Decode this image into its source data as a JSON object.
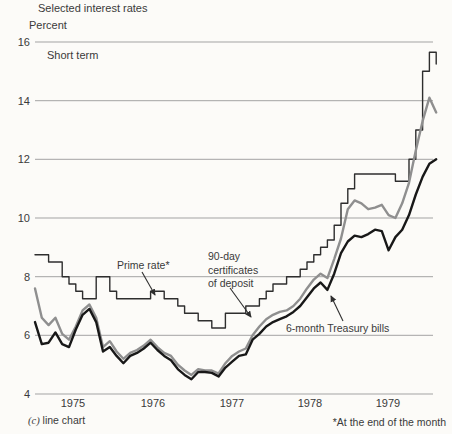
{
  "figure": {
    "title": "Selected interest rates",
    "y_axis_label": "Percent",
    "chart_label": "Short term",
    "caption_prefix": "(c)",
    "caption_text": "line chart",
    "footnote": "*At the end of the month"
  },
  "annotations": {
    "prime": "Prime rate*",
    "cd_line1": "90-day",
    "cd_line2": "certificates",
    "cd_line3": "of deposit",
    "tbill": "6-month Treasury bills"
  },
  "colors": {
    "grid": "#a3a3a3",
    "text": "#3a3a3a",
    "background": "#fcfbf8",
    "prime_line": "#2e2e2e",
    "cd_line": "#8f8f8f",
    "tbill_line": "#181818"
  },
  "chart_data": {
    "type": "line",
    "title": "Selected interest rates",
    "ylabel": "Percent",
    "ylim": [
      4,
      16
    ],
    "y_ticks": [
      "16",
      "14",
      "12",
      "10",
      "8",
      "6",
      "4"
    ],
    "y_tick_values": [
      16,
      14,
      12,
      10,
      8,
      6,
      4
    ],
    "grid": "horizontal",
    "x_unit": "monthly, end of month",
    "x_range": "Jan 1975 - Dec 1979",
    "year_labels": [
      "1975",
      "1976",
      "1977",
      "1978",
      "1979"
    ],
    "series": [
      {
        "name": "Prime rate",
        "style": "step",
        "color": "#2e2e2e",
        "width": 1.4,
        "values": [
          8.75,
          8.75,
          8.5,
          8.5,
          8.0,
          7.75,
          7.5,
          7.25,
          7.25,
          8.0,
          8.0,
          7.5,
          7.25,
          7.25,
          7.25,
          7.25,
          7.25,
          7.5,
          7.5,
          7.25,
          7.25,
          7.0,
          6.75,
          6.75,
          6.5,
          6.5,
          6.25,
          6.25,
          6.75,
          6.75,
          6.75,
          7.0,
          7.0,
          7.25,
          7.5,
          7.75,
          7.75,
          8.0,
          8.0,
          8.25,
          8.5,
          8.75,
          9.0,
          9.25,
          9.75,
          10.5,
          11.0,
          11.5,
          11.5,
          11.5,
          11.5,
          11.5,
          11.5,
          11.25,
          11.25,
          12.0,
          13.0,
          15.0,
          15.65,
          15.25
        ]
      },
      {
        "name": "90-day certificates of deposit",
        "style": "line",
        "color": "#8f8f8f",
        "width": 2.4,
        "values": [
          7.6,
          6.6,
          6.35,
          6.6,
          6.05,
          5.85,
          6.3,
          6.85,
          7.05,
          6.6,
          5.6,
          5.8,
          5.45,
          5.2,
          5.4,
          5.5,
          5.65,
          5.85,
          5.6,
          5.4,
          5.3,
          5.0,
          4.8,
          4.65,
          4.85,
          4.8,
          4.8,
          4.7,
          5.05,
          5.3,
          5.45,
          5.55,
          6.0,
          6.3,
          6.55,
          6.7,
          6.8,
          6.85,
          7.0,
          7.25,
          7.6,
          7.9,
          8.1,
          7.95,
          8.6,
          9.3,
          10.3,
          10.6,
          10.5,
          10.3,
          10.35,
          10.45,
          10.1,
          10.0,
          10.5,
          11.2,
          12.3,
          13.3,
          14.1,
          13.6
        ]
      },
      {
        "name": "6-month Treasury bills",
        "style": "line",
        "color": "#181818",
        "width": 2.4,
        "values": [
          6.45,
          5.7,
          5.75,
          6.1,
          5.7,
          5.6,
          6.2,
          6.7,
          6.9,
          6.45,
          5.45,
          5.6,
          5.3,
          5.05,
          5.3,
          5.4,
          5.55,
          5.75,
          5.5,
          5.3,
          5.15,
          4.85,
          4.65,
          4.5,
          4.75,
          4.75,
          4.72,
          4.6,
          4.9,
          5.1,
          5.3,
          5.35,
          5.85,
          6.05,
          6.3,
          6.45,
          6.55,
          6.65,
          6.8,
          7.0,
          7.3,
          7.6,
          7.8,
          7.55,
          8.1,
          8.8,
          9.2,
          9.4,
          9.35,
          9.45,
          9.6,
          9.55,
          8.9,
          9.35,
          9.6,
          10.1,
          10.8,
          11.4,
          11.85,
          12.0
        ]
      }
    ]
  }
}
